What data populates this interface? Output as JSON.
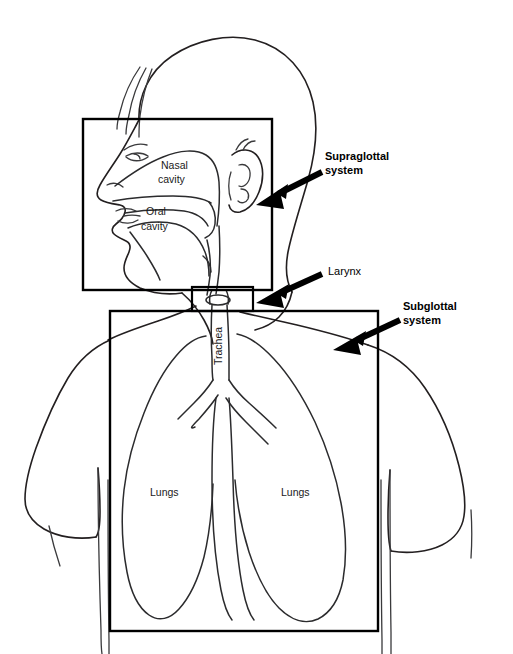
{
  "figure": {
    "background_color": "#ffffff",
    "line_color": "#231f20",
    "arrow_color": "#000000"
  },
  "callouts": [
    {
      "id": "supraglottal",
      "line1": "Supraglottal",
      "line2": "system",
      "weight": "bold",
      "text_x": 325,
      "text_y": 160,
      "arrow_from_x": 322,
      "arrow_from_y": 172,
      "arrow_to_x": 256,
      "arrow_to_y": 205
    },
    {
      "id": "larynx",
      "line1": "Larynx",
      "line2": "",
      "weight": "normal",
      "text_x": 328,
      "text_y": 275,
      "arrow_from_x": 322,
      "arrow_from_y": 274,
      "arrow_to_x": 256,
      "arrow_to_y": 303
    },
    {
      "id": "subglottal",
      "line1": "Subglottal",
      "line2": "system",
      "weight": "bold",
      "text_x": 403,
      "text_y": 310,
      "arrow_from_x": 400,
      "arrow_from_y": 320,
      "arrow_to_x": 333,
      "arrow_to_y": 350
    }
  ],
  "inner_labels": [
    {
      "id": "nasal-cavity",
      "line1": "Nasal",
      "line2": "cavity",
      "x": 161,
      "y": 169
    },
    {
      "id": "oral-cavity",
      "line1": "Oral",
      "line2": "cavity",
      "x": 143,
      "y": 215
    },
    {
      "id": "lung-left",
      "line1": "Lungs",
      "line2": "",
      "x": 150,
      "y": 496
    },
    {
      "id": "lung-right",
      "line1": "Lungs",
      "line2": "",
      "x": 281,
      "y": 496
    }
  ],
  "vertical_labels": [
    {
      "id": "trachea",
      "text": "Trachea",
      "x": 222,
      "y": 365
    }
  ],
  "boxes": [
    {
      "id": "supraglottal-box",
      "x": 83,
      "y": 119,
      "width": 189,
      "height": 171
    },
    {
      "id": "larynx-box",
      "x": 192,
      "y": 287,
      "width": 61,
      "height": 24
    },
    {
      "id": "subglottal-box",
      "x": 110,
      "y": 311,
      "width": 268,
      "height": 320
    }
  ]
}
